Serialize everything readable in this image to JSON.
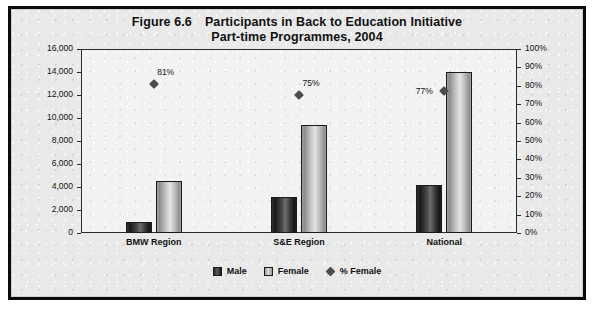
{
  "figure": {
    "number_label": "Figure 6.6",
    "title_line1": "Participants in Back to Education Initiative",
    "title_line2": "Part-time Programmes, 2004"
  },
  "legend": {
    "male_label": "Male",
    "female_label": "Female",
    "pct_female_label": "% Female"
  },
  "chart_data": {
    "type": "bar",
    "xlabel": "",
    "ylabel": "",
    "categories": [
      "BMW Region",
      "S&E Region",
      "National"
    ],
    "series": [
      {
        "name": "Male",
        "axis": "left",
        "values": [
          1000,
          3100,
          4200
        ]
      },
      {
        "name": "Female",
        "axis": "left",
        "values": [
          4500,
          9400,
          14000
        ]
      },
      {
        "name": "% Female",
        "axis": "right",
        "type": "scatter",
        "values": [
          81,
          75,
          77
        ],
        "labels": [
          "81%",
          "75%",
          "77%"
        ]
      }
    ],
    "ylim": [
      0,
      16000
    ],
    "ylim_right": [
      0,
      100
    ],
    "y_ticks": [
      0,
      2000,
      4000,
      6000,
      8000,
      10000,
      12000,
      14000,
      16000
    ],
    "y_tick_labels": [
      "0",
      "2,000",
      "4,000",
      "6,000",
      "8,000",
      "10,000",
      "12,000",
      "14,000",
      "16,000"
    ],
    "y_ticks_right": [
      0,
      10,
      20,
      30,
      40,
      50,
      60,
      70,
      80,
      90,
      100
    ],
    "y_tick_labels_right": [
      "0%",
      "10%",
      "20%",
      "30%",
      "40%",
      "50%",
      "60%",
      "70%",
      "80%",
      "90%",
      "100%"
    ],
    "grid": false,
    "legend_position": "bottom"
  },
  "colors": {
    "male_bar": "#2f2f2f",
    "female_bar": "#c8c8c8",
    "marker": "#4c4c4c",
    "frame": "#0b0b0b",
    "plot_background": "#f2f2f2"
  }
}
